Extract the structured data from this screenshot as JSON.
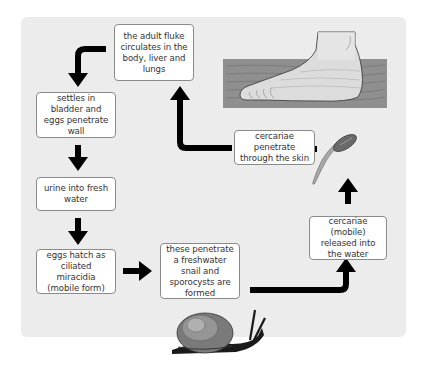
{
  "diagram": {
    "title": "",
    "type": "life-cycle",
    "stages": [
      {
        "id": "adult",
        "text": "the adult fluke circulates in the body, liver and lungs"
      },
      {
        "id": "bladder",
        "text": "settles in bladder and eggs penetrate wall"
      },
      {
        "id": "urine",
        "text": "urine into fresh water"
      },
      {
        "id": "hatch",
        "text": "eggs hatch as ciliated miracidia (mobile form)"
      },
      {
        "id": "snail",
        "text": "these penetrate a freshwater snail and sporocysts are formed"
      },
      {
        "id": "released",
        "text": "cercariae (mobile) released into the water"
      },
      {
        "id": "skin",
        "text": "cercariae penetrate through the skin"
      }
    ],
    "illustrations": [
      "foot-in-water",
      "cercaria",
      "snail"
    ],
    "colors": {
      "background": "#ececec",
      "box_fill": "#ffffff",
      "box_border": "#8a8a8a",
      "arrow": "#000000",
      "water": "#8f8f8f",
      "text": "#333333"
    }
  }
}
